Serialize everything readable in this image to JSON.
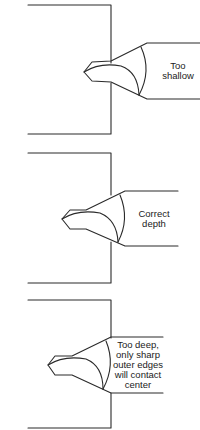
{
  "diagram": {
    "panels": [
      {
        "id": "too-shallow",
        "label": "Too\nshallow"
      },
      {
        "id": "correct-depth",
        "label": "Correct\ndepth"
      },
      {
        "id": "too-deep",
        "label": "Too deep,\nonly sharp\nouter edges\nwill contact\ncenter"
      }
    ]
  }
}
